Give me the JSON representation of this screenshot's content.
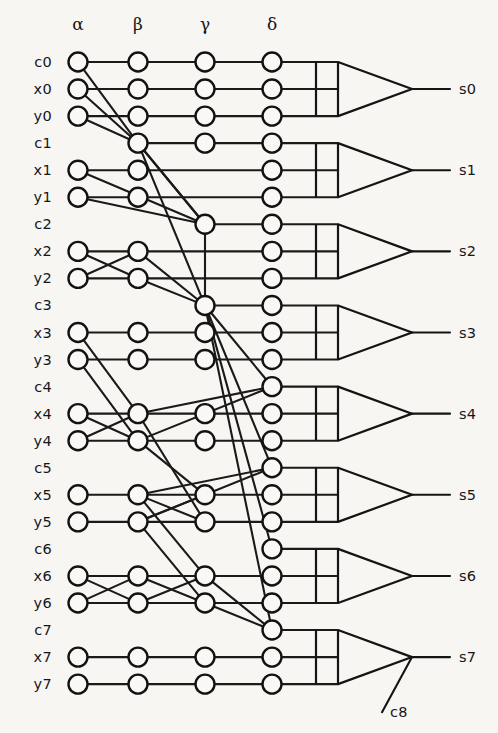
{
  "figure": {
    "caption": "Figure 5. Example of a",
    "caption_visible": false,
    "background_color": "#f7f6f3",
    "ink_color": "#16161a",
    "node_fill": "#f9f8f5"
  },
  "geometry": {
    "width": 498,
    "height": 733,
    "row_top_y": 62,
    "row_spacing": 27.05,
    "node_radius": 9.5,
    "column_x": [
      78,
      138,
      205,
      272
    ],
    "gate_back_x": 338,
    "gate_bar_x": 316,
    "gate_apex_x": 412,
    "gate_output_end_x": 450,
    "output_label_x": 459,
    "label_x": 52,
    "header_y": 30
  },
  "columns": [
    {
      "name": "alpha",
      "label": "α",
      "x": 78
    },
    {
      "name": "beta",
      "label": "β",
      "x": 138
    },
    {
      "name": "gamma",
      "label": "γ",
      "x": 205
    },
    {
      "name": "delta",
      "label": "δ",
      "x": 272
    }
  ],
  "rows": [
    {
      "id": "c0",
      "label": "c0",
      "index": 0,
      "nodes": [
        1,
        1,
        1,
        1
      ]
    },
    {
      "id": "x0",
      "label": "x0",
      "index": 1,
      "nodes": [
        1,
        1,
        1,
        1
      ]
    },
    {
      "id": "y0",
      "label": "y0",
      "index": 2,
      "nodes": [
        1,
        1,
        1,
        1
      ]
    },
    {
      "id": "c1",
      "label": "c1",
      "index": 3,
      "nodes": [
        0,
        1,
        1,
        1
      ]
    },
    {
      "id": "x1",
      "label": "x1",
      "index": 4,
      "nodes": [
        1,
        1,
        0,
        1
      ]
    },
    {
      "id": "y1",
      "label": "y1",
      "index": 5,
      "nodes": [
        1,
        1,
        0,
        1
      ]
    },
    {
      "id": "c2",
      "label": "c2",
      "index": 6,
      "nodes": [
        0,
        0,
        1,
        1
      ]
    },
    {
      "id": "x2",
      "label": "x2",
      "index": 7,
      "nodes": [
        1,
        1,
        0,
        1
      ]
    },
    {
      "id": "y2",
      "label": "y2",
      "index": 8,
      "nodes": [
        1,
        1,
        0,
        1
      ]
    },
    {
      "id": "c3",
      "label": "c3",
      "index": 9,
      "nodes": [
        0,
        0,
        1,
        1
      ]
    },
    {
      "id": "x3",
      "label": "x3",
      "index": 10,
      "nodes": [
        1,
        1,
        1,
        1
      ]
    },
    {
      "id": "y3",
      "label": "y3",
      "index": 11,
      "nodes": [
        1,
        1,
        1,
        1
      ]
    },
    {
      "id": "c4",
      "label": "c4",
      "index": 12,
      "nodes": [
        0,
        0,
        0,
        1
      ]
    },
    {
      "id": "x4",
      "label": "x4",
      "index": 13,
      "nodes": [
        1,
        1,
        1,
        1
      ]
    },
    {
      "id": "y4",
      "label": "y4",
      "index": 14,
      "nodes": [
        1,
        1,
        1,
        1
      ]
    },
    {
      "id": "c5",
      "label": "c5",
      "index": 15,
      "nodes": [
        0,
        0,
        0,
        1
      ]
    },
    {
      "id": "x5",
      "label": "x5",
      "index": 16,
      "nodes": [
        1,
        1,
        1,
        1
      ]
    },
    {
      "id": "y5",
      "label": "y5",
      "index": 17,
      "nodes": [
        1,
        1,
        1,
        1
      ]
    },
    {
      "id": "c6",
      "label": "c6",
      "index": 18,
      "nodes": [
        0,
        0,
        0,
        1
      ]
    },
    {
      "id": "x6",
      "label": "x6",
      "index": 19,
      "nodes": [
        1,
        1,
        1,
        1
      ]
    },
    {
      "id": "y6",
      "label": "y6",
      "index": 20,
      "nodes": [
        1,
        1,
        1,
        1
      ]
    },
    {
      "id": "c7",
      "label": "c7",
      "index": 21,
      "nodes": [
        0,
        0,
        0,
        1
      ]
    },
    {
      "id": "x7",
      "label": "x7",
      "index": 22,
      "nodes": [
        1,
        1,
        1,
        1
      ]
    },
    {
      "id": "y7",
      "label": "y7",
      "index": 23,
      "nodes": [
        1,
        1,
        1,
        1
      ]
    }
  ],
  "edges": [
    [
      0,
      0,
      0,
      1
    ],
    [
      0,
      1,
      0,
      2
    ],
    [
      0,
      2,
      0,
      3
    ],
    [
      1,
      0,
      1,
      1
    ],
    [
      1,
      1,
      1,
      2
    ],
    [
      1,
      2,
      1,
      3
    ],
    [
      2,
      0,
      2,
      1
    ],
    [
      2,
      1,
      2,
      2
    ],
    [
      2,
      2,
      2,
      3
    ],
    [
      0,
      0,
      3,
      1
    ],
    [
      1,
      0,
      3,
      1
    ],
    [
      2,
      0,
      3,
      1
    ],
    [
      3,
      1,
      3,
      2
    ],
    [
      3,
      2,
      3,
      3
    ],
    [
      4,
      0,
      4,
      1
    ],
    [
      5,
      0,
      5,
      1
    ],
    [
      4,
      1,
      4,
      3
    ],
    [
      5,
      1,
      5,
      3
    ],
    [
      4,
      0,
      6,
      2
    ],
    [
      5,
      0,
      6,
      2
    ],
    [
      3,
      1,
      6,
      2
    ],
    [
      3,
      1,
      6,
      2
    ],
    [
      6,
      2,
      6,
      3
    ],
    [
      7,
      0,
      7,
      1
    ],
    [
      8,
      0,
      8,
      1
    ],
    [
      7,
      0,
      8,
      1
    ],
    [
      8,
      0,
      7,
      1
    ],
    [
      7,
      1,
      7,
      3
    ],
    [
      8,
      1,
      8,
      3
    ],
    [
      7,
      1,
      9,
      2
    ],
    [
      8,
      1,
      9,
      2
    ],
    [
      3,
      1,
      9,
      2
    ],
    [
      6,
      2,
      9,
      2
    ],
    [
      9,
      2,
      9,
      3
    ],
    [
      10,
      0,
      10,
      1
    ],
    [
      10,
      1,
      10,
      2
    ],
    [
      10,
      2,
      10,
      3
    ],
    [
      11,
      0,
      11,
      1
    ],
    [
      11,
      1,
      11,
      2
    ],
    [
      11,
      2,
      11,
      3
    ],
    [
      13,
      0,
      13,
      1
    ],
    [
      14,
      0,
      14,
      1
    ],
    [
      13,
      0,
      14,
      1
    ],
    [
      14,
      0,
      13,
      1
    ],
    [
      10,
      0,
      13,
      1
    ],
    [
      11,
      0,
      14,
      1
    ],
    [
      13,
      1,
      13,
      2
    ],
    [
      14,
      1,
      14,
      2
    ],
    [
      13,
      2,
      13,
      3
    ],
    [
      14,
      2,
      14,
      3
    ],
    [
      9,
      2,
      12,
      3
    ],
    [
      13,
      1,
      12,
      3
    ],
    [
      14,
      1,
      12,
      3
    ],
    [
      16,
      0,
      16,
      1
    ],
    [
      17,
      0,
      17,
      1
    ],
    [
      16,
      1,
      16,
      2
    ],
    [
      17,
      1,
      17,
      2
    ],
    [
      16,
      1,
      17,
      2
    ],
    [
      17,
      1,
      16,
      2
    ],
    [
      16,
      2,
      16,
      3
    ],
    [
      17,
      2,
      17,
      3
    ],
    [
      9,
      2,
      15,
      3
    ],
    [
      16,
      1,
      15,
      3
    ],
    [
      17,
      1,
      15,
      3
    ],
    [
      14,
      1,
      16,
      2
    ],
    [
      13,
      1,
      17,
      2
    ],
    [
      19,
      0,
      19,
      1
    ],
    [
      20,
      0,
      20,
      1
    ],
    [
      19,
      0,
      20,
      1
    ],
    [
      20,
      0,
      19,
      1
    ],
    [
      19,
      1,
      19,
      2
    ],
    [
      20,
      1,
      20,
      2
    ],
    [
      19,
      1,
      20,
      2
    ],
    [
      20,
      1,
      19,
      2
    ],
    [
      19,
      2,
      19,
      3
    ],
    [
      20,
      2,
      20,
      3
    ],
    [
      9,
      2,
      18,
      3
    ],
    [
      16,
      1,
      19,
      2
    ],
    [
      17,
      1,
      20,
      2
    ],
    [
      19,
      2,
      21,
      3
    ],
    [
      20,
      2,
      21,
      3
    ],
    [
      9,
      2,
      21,
      3
    ],
    [
      22,
      0,
      22,
      1
    ],
    [
      22,
      1,
      22,
      2
    ],
    [
      22,
      2,
      22,
      3
    ],
    [
      23,
      0,
      23,
      1
    ],
    [
      23,
      1,
      23,
      2
    ],
    [
      23,
      2,
      23,
      3
    ]
  ],
  "gates": [
    {
      "name": "gate-s0",
      "inputs": [
        0,
        1,
        2
      ],
      "output_label": "s0",
      "secondary_label": null
    },
    {
      "name": "gate-s1",
      "inputs": [
        3,
        4,
        5
      ],
      "output_label": "s1",
      "secondary_label": null
    },
    {
      "name": "gate-s2",
      "inputs": [
        6,
        7,
        8
      ],
      "output_label": "s2",
      "secondary_label": null
    },
    {
      "name": "gate-s3",
      "inputs": [
        9,
        10,
        11
      ],
      "output_label": "s3",
      "secondary_label": null
    },
    {
      "name": "gate-s4",
      "inputs": [
        12,
        13,
        14
      ],
      "output_label": "s4",
      "secondary_label": null
    },
    {
      "name": "gate-s5",
      "inputs": [
        15,
        16,
        17
      ],
      "output_label": "s5",
      "secondary_label": null
    },
    {
      "name": "gate-s6",
      "inputs": [
        18,
        19,
        20
      ],
      "output_label": "s6",
      "secondary_label": null
    },
    {
      "name": "gate-s7",
      "inputs": [
        21,
        22,
        23
      ],
      "output_label": "s7",
      "secondary_label": "c8"
    }
  ]
}
